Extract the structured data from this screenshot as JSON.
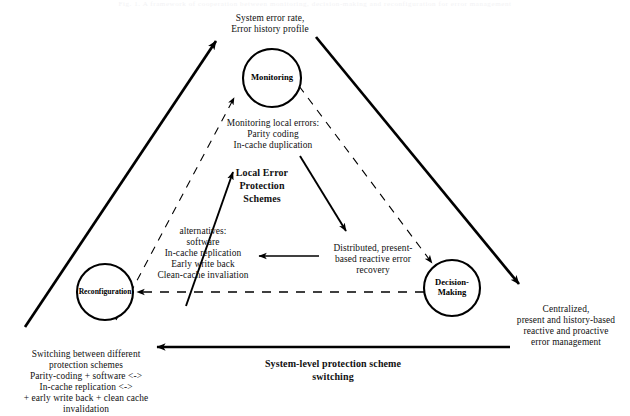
{
  "figure": {
    "ghost_header": "Fig. 1.  A framework of cooperation between monitoring, decision-making and reconfiguration for error management",
    "nodes": [
      {
        "id": "monitoring",
        "label": "Monitoring",
        "cx": 272,
        "cy": 78,
        "r": 29
      },
      {
        "id": "reconfiguration",
        "label": "Reconfiguration",
        "cx": 105,
        "cy": 292,
        "r": 28
      },
      {
        "id": "decision-making",
        "label_line1": "Decision-",
        "label_line2": "Making",
        "cx": 452,
        "cy": 288,
        "r": 28
      }
    ],
    "labels": {
      "top_feedback": "System error rate,\nError history profile",
      "top_feedback_line1": "System error rate,",
      "top_feedback_line2": "Error history profile",
      "monitoring_local": "Monitoring local errors:\nParity coding\nIn-cache duplication",
      "monitoring_local_l1": "Monitoring local errors:",
      "monitoring_local_l2": "Parity coding",
      "monitoring_local_l3": "In-cache duplication",
      "local_error_schemes": "Local Error\nProtection\nSchemes",
      "local_error_schemes_l1": "Local Error",
      "local_error_schemes_l2": "Protection",
      "local_error_schemes_l3": "Schemes",
      "alternatives": "alternatives:\nsoftware\nIn-cache replication\nEarly write back\nClean-cache invaliation",
      "alternatives_l1": "alternatives:",
      "alternatives_l2": "software",
      "alternatives_l3": "In-cache replication",
      "alternatives_l4": "Early write back",
      "alternatives_l5": "Clean-cache invaliation",
      "distributed_recovery": "Distributed, present-\nbased reactive error\nrecovery",
      "distributed_recovery_l1": "Distributed, present-",
      "distributed_recovery_l2": "based reactive error",
      "distributed_recovery_l3": "recovery",
      "centralized": "Centralized,\npresent and history-based\nreactive and proactive\nerror management",
      "centralized_l1": "Centralized,",
      "centralized_l2": "present and history-based",
      "centralized_l3": "reactive and proactive",
      "centralized_l4": "error management",
      "switching": "Switching between different\nprotection schemes\nParity-coding + software <->\nIn-cache replication <->\n+ early write back + clean cache\ninvalidation",
      "switching_l1": "Switching between different",
      "switching_l2": "protection schemes",
      "switching_l3": "Parity-coding + software <->",
      "switching_l4": "In-cache replication <->",
      "switching_l5": "+ early write back + clean cache",
      "switching_l6": "invalidation",
      "system_level_switching": "System-level protection scheme\nswitching",
      "system_level_switching_l1": "System-level protection scheme",
      "system_level_switching_l2": "switching"
    },
    "colors": {
      "ink": "#000000",
      "background": "#ffffff",
      "ghost_text": "#f2f2f4"
    },
    "edges": [
      {
        "id": "outer-left-up",
        "style": "solid",
        "from": [
          25,
          327
        ],
        "to": [
          216,
          41
        ],
        "weight": 2.6,
        "arrow": "end"
      },
      {
        "id": "outer-right-down",
        "style": "solid",
        "from": [
          316,
          37
        ],
        "to": [
          519,
          284
        ],
        "weight": 2.6,
        "arrow": "end"
      },
      {
        "id": "outer-bottom-left",
        "style": "solid",
        "from": [
          510,
          347
        ],
        "to": [
          157,
          347
        ],
        "weight": 2.2,
        "arrow": "end"
      },
      {
        "id": "dashed-left-up",
        "style": "dashed",
        "from": [
          116,
          320
        ],
        "to": [
          234,
          98
        ],
        "weight": 1.1,
        "arrow": "end"
      },
      {
        "id": "dashed-right-down",
        "style": "dashed",
        "from": [
          299,
          86
        ],
        "to": [
          432,
          263
        ],
        "weight": 1.1,
        "arrow": "end"
      },
      {
        "id": "dashed-horizontal",
        "style": "dashed",
        "from": [
          424,
          292
        ],
        "to": [
          137,
          292
        ],
        "weight": 1.4,
        "arrow": "end"
      },
      {
        "id": "inner-left-up",
        "style": "solid",
        "from": [
          186,
          306
        ],
        "to": [
          233,
          172
        ],
        "weight": 1.8,
        "arrow": "end"
      },
      {
        "id": "inner-right-down",
        "style": "solid",
        "from": [
          300,
          156
        ],
        "to": [
          346,
          231
        ],
        "weight": 1.8,
        "arrow": "end"
      },
      {
        "id": "inner-horizontal",
        "style": "solid",
        "from": [
          319,
          256
        ],
        "to": [
          259,
          256
        ],
        "weight": 1.6,
        "arrow": "end"
      }
    ]
  }
}
